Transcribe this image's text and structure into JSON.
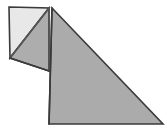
{
  "figure": {
    "title": "folded-paper-triangle-diagram",
    "description": "Line drawing of a right triangle of paper with a small corner flap folded back at the upper left",
    "canvas": {
      "width": 167,
      "height": 136,
      "background": "#ffffff"
    },
    "colors": {
      "paper_front": "#ababab",
      "paper_back": "#e8e8e8",
      "flap_shadow": "#adadad",
      "outline": "#3a3a3a",
      "fold_line": "#555555",
      "background": "#ffffff"
    },
    "stroke_width": 1.6,
    "shapes": [
      {
        "name": "main-triangle",
        "role": "paper-front",
        "fill": "#ababab",
        "points": "52,8 163,124 49,124"
      },
      {
        "name": "folded-back-flap",
        "role": "paper-back",
        "fill": "#e8e8e8",
        "points": "9,7 49,8 10,58"
      },
      {
        "name": "flap-underside-strip",
        "role": "paper-front-strip",
        "fill": "#adadad",
        "points": "49,8 49,71 10,58"
      }
    ],
    "edges": [
      {
        "name": "flap-top-edge",
        "from": "9,7",
        "to": "49,8",
        "kind": "outline"
      },
      {
        "name": "flap-left-edge",
        "from": "9,7",
        "to": "10,58",
        "kind": "outline"
      },
      {
        "name": "flap-fold-diagonal",
        "from": "10,58",
        "to": "49,8",
        "kind": "fold"
      },
      {
        "name": "flap-lower-edge",
        "from": "10,58",
        "to": "49,71",
        "kind": "outline"
      },
      {
        "name": "vertical-crease",
        "from": "49,8",
        "to": "49,71",
        "kind": "fold"
      },
      {
        "name": "triangle-hypotenuse",
        "from": "52,8",
        "to": "163,124",
        "kind": "outline"
      },
      {
        "name": "triangle-base",
        "from": "49,124",
        "to": "163,124",
        "kind": "outline"
      },
      {
        "name": "triangle-left-side",
        "from": "52,8",
        "to": "49,124",
        "kind": "outline"
      }
    ],
    "vertices": [
      {
        "name": "apex",
        "x": 52,
        "y": 8
      },
      {
        "name": "bottom-left",
        "x": 49,
        "y": 124
      },
      {
        "name": "bottom-right",
        "x": 163,
        "y": 124
      },
      {
        "name": "flap-top-left",
        "x": 9,
        "y": 7
      },
      {
        "name": "flap-bottom-left",
        "x": 10,
        "y": 58
      },
      {
        "name": "crease-bottom",
        "x": 49,
        "y": 71
      }
    ]
  }
}
